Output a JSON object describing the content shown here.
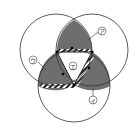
{
  "diagram": {
    "labels": {
      "a": "ア",
      "b": "イ",
      "c": "ウ",
      "d": "エ"
    },
    "colors": {
      "shade": "#6e6e6e",
      "line": "#333333",
      "background": "#ffffff"
    }
  }
}
